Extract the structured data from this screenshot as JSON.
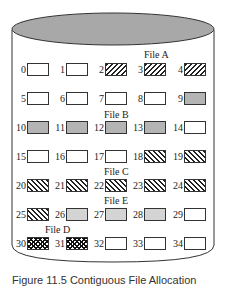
{
  "diagram": {
    "type": "disk-block-allocation",
    "colors": {
      "top_ellipse": "#a8a8a8",
      "outline": "#333333",
      "file_b_fill": "#b4b4b4",
      "file_e_fill": "#d4d4d4"
    },
    "file_labels": [
      {
        "id": "A",
        "text": "File A"
      },
      {
        "id": "B",
        "text": "File B"
      },
      {
        "id": "C",
        "text": "File C"
      },
      {
        "id": "E",
        "text": "File E"
      },
      {
        "id": "D",
        "text": "File D"
      }
    ],
    "blocks": [
      {
        "n": "0",
        "file": ""
      },
      {
        "n": "1",
        "file": ""
      },
      {
        "n": "2",
        "file": "A"
      },
      {
        "n": "3",
        "file": "A"
      },
      {
        "n": "4",
        "file": "A"
      },
      {
        "n": "5",
        "file": ""
      },
      {
        "n": "6",
        "file": ""
      },
      {
        "n": "7",
        "file": ""
      },
      {
        "n": "8",
        "file": ""
      },
      {
        "n": "9",
        "file": "B"
      },
      {
        "n": "10",
        "file": "B"
      },
      {
        "n": "11",
        "file": "B"
      },
      {
        "n": "12",
        "file": "B"
      },
      {
        "n": "13",
        "file": "B"
      },
      {
        "n": "14",
        "file": ""
      },
      {
        "n": "15",
        "file": ""
      },
      {
        "n": "16",
        "file": ""
      },
      {
        "n": "17",
        "file": ""
      },
      {
        "n": "18",
        "file": "C"
      },
      {
        "n": "19",
        "file": "C"
      },
      {
        "n": "20",
        "file": "C"
      },
      {
        "n": "21",
        "file": "C"
      },
      {
        "n": "22",
        "file": "C"
      },
      {
        "n": "23",
        "file": "C"
      },
      {
        "n": "24",
        "file": "C"
      },
      {
        "n": "25",
        "file": "C"
      },
      {
        "n": "26",
        "file": "E"
      },
      {
        "n": "27",
        "file": "E"
      },
      {
        "n": "28",
        "file": "E"
      },
      {
        "n": "29",
        "file": ""
      },
      {
        "n": "30",
        "file": "D"
      },
      {
        "n": "31",
        "file": "D"
      },
      {
        "n": "32",
        "file": ""
      },
      {
        "n": "33",
        "file": ""
      },
      {
        "n": "34",
        "file": ""
      }
    ],
    "caption": "Figure 11.5 Contiguous File Allocation"
  }
}
